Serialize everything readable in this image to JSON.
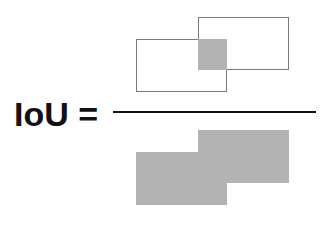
{
  "formula": {
    "lhs": "IoU",
    "equals": "=",
    "label_text": "IoU ="
  },
  "numerator": {
    "description": "Area of Overlap (intersection of two boxes)",
    "box_a": {
      "x": 198,
      "y": 17,
      "w": 91,
      "h": 53
    },
    "box_b": {
      "x": 136,
      "y": 39,
      "w": 91,
      "h": 53
    },
    "intersection": {
      "x": 198,
      "y": 39,
      "w": 29,
      "h": 31
    }
  },
  "denominator": {
    "description": "Area of Union (two boxes filled)",
    "box_a": {
      "x": 198,
      "y": 130,
      "w": 91,
      "h": 53
    },
    "box_b": {
      "x": 136,
      "y": 152,
      "w": 91,
      "h": 53
    }
  },
  "colors": {
    "outline": "#7a7a7a",
    "fill": "#b3b3b3",
    "text": "#111111",
    "background": "#ffffff"
  }
}
